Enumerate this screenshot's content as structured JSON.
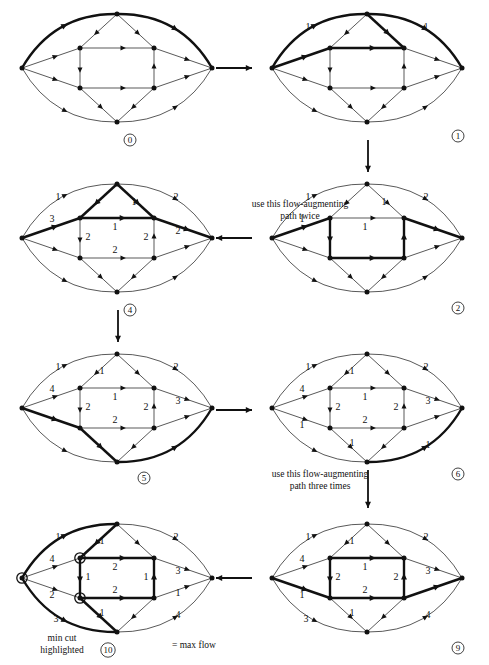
{
  "figure": {
    "notes": {
      "twice": "use this flow-augmenting",
      "twice2": "path twice",
      "three": "use this flow-augmenting",
      "three2": "path three times",
      "mincut1": "min cut",
      "mincut2": "highlighted",
      "maxflow": "= max flow"
    },
    "colors": {
      "ink": "#111111",
      "thin": "#333333",
      "bold": "#000000",
      "paper": "#ffffff"
    }
  },
  "panels": [
    {
      "id": "p0",
      "number": "0",
      "labels": []
    },
    {
      "id": "p1",
      "number": "1",
      "labels": [
        {
          "text": "1",
          "pos": "top-left-outer"
        },
        {
          "text": "1",
          "pos": "top-right-outer"
        }
      ]
    },
    {
      "id": "p2",
      "number": "2",
      "labels": [
        {
          "text": "1",
          "pos": "top-left-outer"
        },
        {
          "text": "2",
          "pos": "top-right-outer"
        },
        {
          "text": "1",
          "pos": "src-to-itl"
        },
        {
          "text": "1",
          "pos": "itr-to-top"
        },
        {
          "text": "1",
          "pos": "itl-to-itr"
        }
      ]
    },
    {
      "id": "p4",
      "number": "4",
      "labels": [
        {
          "text": "1",
          "pos": "top-left-outer"
        },
        {
          "text": "2",
          "pos": "top-right-outer"
        },
        {
          "text": "3",
          "pos": "src-to-itl"
        },
        {
          "text": "1",
          "pos": "itr-to-top"
        },
        {
          "text": "1",
          "pos": "itl-to-itr"
        },
        {
          "text": "2",
          "pos": "itl-to-ibl"
        },
        {
          "text": "2",
          "pos": "ibl-to-ibr"
        },
        {
          "text": "2",
          "pos": "ibr-to-itr"
        },
        {
          "text": "2",
          "pos": "itr-to-sink"
        }
      ]
    },
    {
      "id": "p5",
      "number": "5",
      "labels": [
        {
          "text": "1",
          "pos": "top-left-outer"
        },
        {
          "text": "2",
          "pos": "top-right-outer"
        },
        {
          "text": "1",
          "pos": "top-to-itl"
        },
        {
          "text": "4",
          "pos": "src-to-itl"
        },
        {
          "text": "1",
          "pos": "itl-to-itr"
        },
        {
          "text": "2",
          "pos": "itl-to-ibl"
        },
        {
          "text": "2",
          "pos": "ibl-to-ibr"
        },
        {
          "text": "2",
          "pos": "ibr-to-itr"
        },
        {
          "text": "3",
          "pos": "itr-to-sink"
        }
      ]
    },
    {
      "id": "p6",
      "number": "6",
      "labels": [
        {
          "text": "1",
          "pos": "top-left-outer"
        },
        {
          "text": "2",
          "pos": "top-right-outer"
        },
        {
          "text": "1",
          "pos": "top-to-itl"
        },
        {
          "text": "4",
          "pos": "src-to-itl"
        },
        {
          "text": "1",
          "pos": "src-to-ibl"
        },
        {
          "text": "1",
          "pos": "itl-to-itr"
        },
        {
          "text": "2",
          "pos": "itl-to-ibl"
        },
        {
          "text": "2",
          "pos": "ibl-to-ibr"
        },
        {
          "text": "2",
          "pos": "ibr-to-itr"
        },
        {
          "text": "3",
          "pos": "itr-to-sink"
        },
        {
          "text": "1",
          "pos": "ibl-to-bot"
        },
        {
          "text": "1",
          "pos": "bot-to-sink"
        }
      ]
    },
    {
      "id": "p9",
      "number": "9",
      "labels": [
        {
          "text": "1",
          "pos": "top-left-outer"
        },
        {
          "text": "2",
          "pos": "top-right-outer"
        },
        {
          "text": "1",
          "pos": "top-to-itl"
        },
        {
          "text": "4",
          "pos": "src-to-itl"
        },
        {
          "text": "1",
          "pos": "src-to-ibl"
        },
        {
          "text": "1",
          "pos": "itl-to-itr"
        },
        {
          "text": "2",
          "pos": "itl-to-ibl"
        },
        {
          "text": "2",
          "pos": "ibl-to-ibr"
        },
        {
          "text": "2",
          "pos": "ibr-to-itr"
        },
        {
          "text": "3",
          "pos": "itr-to-sink"
        },
        {
          "text": "1",
          "pos": "ibl-to-bot"
        },
        {
          "text": "3",
          "pos": "src-to-bot"
        },
        {
          "text": "4",
          "pos": "bot-to-sink"
        }
      ]
    },
    {
      "id": "p10",
      "number": "10",
      "labels": [
        {
          "text": "1",
          "pos": "top-left-outer"
        },
        {
          "text": "2",
          "pos": "top-right-outer"
        },
        {
          "text": "1",
          "pos": "top-to-itl"
        },
        {
          "text": "4",
          "pos": "src-to-itl"
        },
        {
          "text": "2",
          "pos": "src-to-ibl"
        },
        {
          "text": "2",
          "pos": "itl-to-itr"
        },
        {
          "text": "1",
          "pos": "itl-to-ibl"
        },
        {
          "text": "2",
          "pos": "ibl-to-ibr"
        },
        {
          "text": "1",
          "pos": "ibr-to-itr"
        },
        {
          "text": "3",
          "pos": "itr-to-sink"
        },
        {
          "text": "1",
          "pos": "ibl-to-bot"
        },
        {
          "text": "3",
          "pos": "src-to-bot"
        },
        {
          "text": "1",
          "pos": "ibr-to-sink"
        },
        {
          "text": "4",
          "pos": "bot-to-sink"
        }
      ]
    }
  ]
}
